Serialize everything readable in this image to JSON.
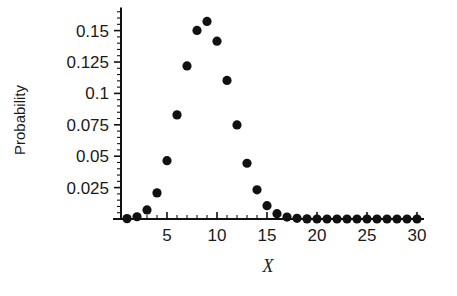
{
  "chart_data": {
    "type": "scatter",
    "title": "",
    "xlabel": "X",
    "ylabel": "Probability",
    "xlim": [
      0,
      30.6
    ],
    "ylim": [
      0,
      0.1675
    ],
    "grid": false,
    "legend": null,
    "x": [
      1,
      2,
      3,
      4,
      5,
      6,
      7,
      8,
      9,
      10,
      11,
      12,
      13,
      14,
      15,
      16,
      17,
      18,
      19,
      20,
      21,
      22,
      23,
      24,
      25,
      26,
      27,
      28,
      29,
      30
    ],
    "values": [
      0.0003,
      0.0018,
      0.0072,
      0.0208,
      0.0464,
      0.0829,
      0.1219,
      0.1501,
      0.1573,
      0.1416,
      0.1103,
      0.0749,
      0.0444,
      0.0232,
      0.0106,
      0.0042,
      0.0015,
      0.0005,
      0.0001,
      0.0,
      0.0,
      0.0,
      0.0,
      0.0,
      0.0,
      0.0,
      0.0,
      0.0,
      0.0,
      0.0
    ],
    "xticks": [
      5,
      10,
      15,
      20,
      25,
      30
    ],
    "xtick_labels": [
      "5",
      "10",
      "15",
      "20",
      "25",
      "30"
    ],
    "yticks": [
      0.025,
      0.05,
      0.075,
      0.1,
      0.125,
      0.15
    ],
    "ytick_labels": [
      "0.025",
      "0.05",
      "0.075",
      "0.1",
      "0.125",
      "0.15"
    ],
    "x_minor_step": 1,
    "y_minor_step": 0.005,
    "marker": "circle",
    "marker_color": "#111111",
    "marker_size": 4.6,
    "axis_color": "#111111",
    "background": "#ffffff"
  }
}
